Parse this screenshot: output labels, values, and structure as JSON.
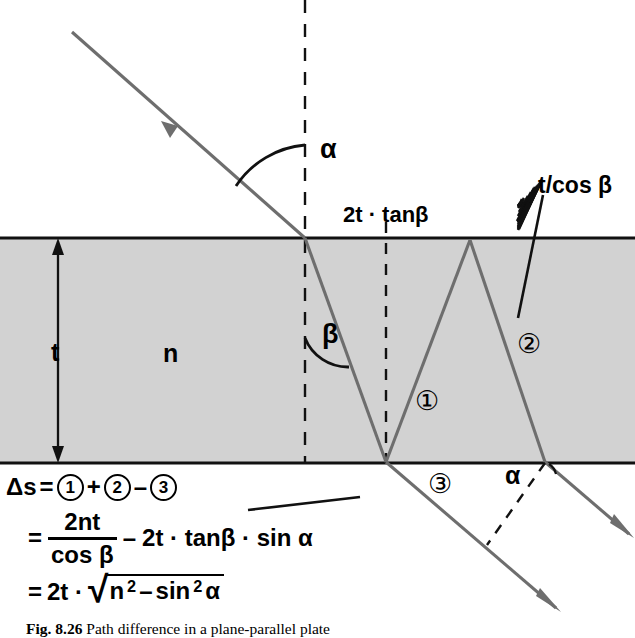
{
  "figure": {
    "caption_label": "Fig. 8.26",
    "caption_text": "Path difference in a plane-parallel plate"
  },
  "colors": {
    "plate_fill": "#d2d2d2",
    "ray": "#6e6e6e",
    "outline": "#111111",
    "background": "#ffffff"
  },
  "labels": {
    "incidence_angle": "α",
    "refraction_angle": "β",
    "exit_angle": "α",
    "thickness": "t",
    "refractive_index": "n",
    "lateral_shift": "2t · tanβ",
    "path_in_plate": "t/cos β",
    "ray_one": "①",
    "ray_two": "②",
    "ray_three": "③"
  },
  "equations": {
    "line1": {
      "lhs": "Δs",
      "eq": "=",
      "term1": "1",
      "op1": "+",
      "term2": "2",
      "op2": "–",
      "term3": "3"
    },
    "line2": {
      "eq": "=",
      "numerator": "2nt",
      "denominator": "cos β",
      "op": "–",
      "rest": "2t · tanβ · sin α"
    },
    "line3": {
      "eq": "=",
      "prefix": "2t ·",
      "radical_sign": "√",
      "radicand_a": "n",
      "radicand_a_sup": "2",
      "radicand_op": "–",
      "radicand_b": "sin",
      "radicand_b_sup": "2",
      "radicand_c": "α"
    }
  },
  "geometry": {
    "plate_top_y": 238,
    "plate_bottom_y": 463,
    "entry_x": 305,
    "normal_x": 305,
    "second_dash_x": 386,
    "bounce_top_x": 470,
    "exit_x": 545
  }
}
